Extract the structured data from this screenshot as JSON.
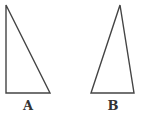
{
  "diagram": {
    "stroke_color": "#444444",
    "triangles": [
      {
        "id": "A",
        "label": "A",
        "type": "right triangle",
        "vertices": [
          [
            6,
            5
          ],
          [
            6,
            93
          ],
          [
            50,
            93
          ]
        ]
      },
      {
        "id": "B",
        "label": "B",
        "type": "acute scalene triangle",
        "vertices": [
          [
            120,
            5
          ],
          [
            91,
            93
          ],
          [
            134,
            93
          ]
        ]
      }
    ]
  }
}
